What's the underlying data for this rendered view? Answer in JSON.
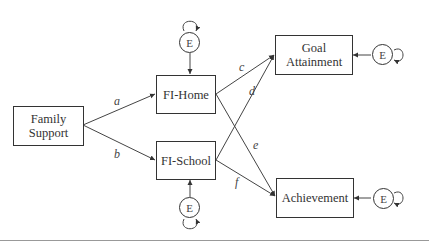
{
  "diagram": {
    "type": "path-model",
    "nodes": {
      "family_support": "Family\nSupport",
      "fi_home": "FI-Home",
      "fi_school": "FI-School",
      "goal_attainment": "Goal\nAttainment",
      "achievement": "Achievement"
    },
    "error_terms": {
      "fi_home": "E",
      "fi_school": "E",
      "goal_attainment": "E",
      "achievement": "E"
    },
    "paths": [
      {
        "from": "family_support",
        "to": "fi_home",
        "label": "a"
      },
      {
        "from": "family_support",
        "to": "fi_school",
        "label": "b"
      },
      {
        "from": "fi_home",
        "to": "goal_attainment",
        "label": "c"
      },
      {
        "from": "fi_school",
        "to": "goal_attainment",
        "label": "d"
      },
      {
        "from": "fi_home",
        "to": "achievement",
        "label": "e"
      },
      {
        "from": "fi_school",
        "to": "achievement",
        "label": "f"
      }
    ],
    "labels": {
      "a": "a",
      "b": "b",
      "c": "c",
      "d": "d",
      "e": "e",
      "f": "f"
    },
    "node_lines": {
      "family_support": [
        "Family",
        "Support"
      ],
      "goal_attainment": [
        "Goal",
        "Attainment"
      ]
    }
  }
}
